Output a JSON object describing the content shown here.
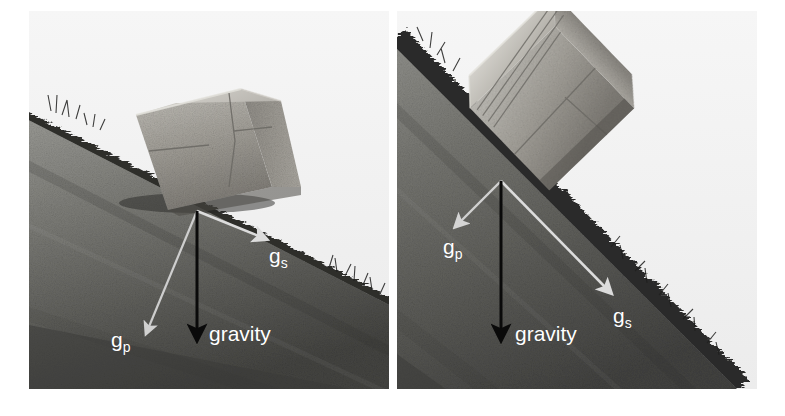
{
  "figure": {
    "background_color": "#ffffff",
    "width": 785,
    "height": 416
  },
  "colors": {
    "sky": "#f1f1f1",
    "slope_light": "#8f8f8f",
    "slope_dark": "#4a4a4a",
    "grass_edge": "#2b2b2b",
    "boulder_light": "#b8b6b0",
    "boulder_mid": "#9a9790",
    "boulder_dark": "#6f6d68",
    "component_arrow": "#d8d8d8",
    "gravity_arrow": "#0a0a0a",
    "label_text": "#ffffff"
  },
  "panels": [
    {
      "id": "panel-left",
      "name": "gentle-slope-panel",
      "slope_description": "gentle grassy hillslope with a rectangular boulder resting on it",
      "vectors": [
        {
          "id": "gravity",
          "label": "gravity",
          "sublabel": "",
          "color": "#0a0a0a",
          "direction": "down",
          "label_x": 176,
          "label_y": 325,
          "x1": 168,
          "y1": 200,
          "x2": 168,
          "y2": 327
        },
        {
          "id": "gs",
          "label": "g",
          "sublabel": "s",
          "color": "#d8d8d8",
          "direction": "down-slope (parallel to surface)",
          "label_x": 240,
          "label_y": 250,
          "x1": 168,
          "y1": 200,
          "x2": 234,
          "y2": 227
        },
        {
          "id": "gp",
          "label": "g",
          "sublabel": "p",
          "color": "#d8d8d8",
          "direction": "perpendicular into slope",
          "label_x": 84,
          "label_y": 334,
          "x1": 168,
          "y1": 200,
          "x2": 119,
          "y2": 320
        }
      ]
    },
    {
      "id": "panel-right",
      "name": "steep-slope-panel",
      "slope_description": "steep grassy hillslope with a tilted rectangular boulder sliding on it",
      "vectors": [
        {
          "id": "gravity",
          "label": "gravity",
          "sublabel": "",
          "color": "#0a0a0a",
          "direction": "down",
          "label_x": 508,
          "label_y": 330,
          "x1": 500,
          "y1": 180,
          "x2": 500,
          "y2": 332
        },
        {
          "id": "gs",
          "label": "g",
          "sublabel": "s",
          "color": "#d8d8d8",
          "direction": "down-slope (parallel to surface)",
          "label_x": 610,
          "label_y": 321,
          "x1": 500,
          "y1": 180,
          "x2": 604,
          "y2": 288
        },
        {
          "id": "gp",
          "label": "g",
          "sublabel": "p",
          "color": "#d8d8d8",
          "direction": "perpendicular into slope",
          "label_x": 442,
          "label_y": 251,
          "x1": 500,
          "y1": 180,
          "x2": 460,
          "y2": 221
        }
      ]
    }
  ]
}
